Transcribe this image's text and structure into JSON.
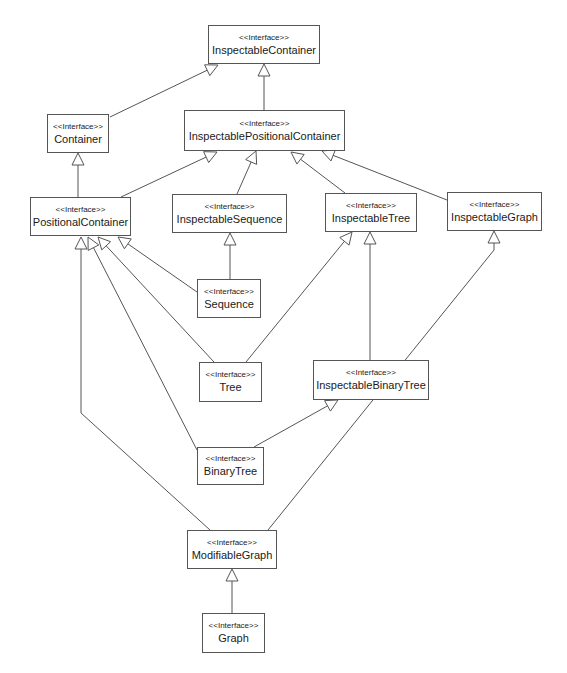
{
  "diagram": {
    "type": "uml-class-inheritance",
    "stereotype": "<<Interface>>",
    "nodes": [
      {
        "id": "InspectableContainer",
        "label": "InspectableContainer",
        "x": 208,
        "y": 25,
        "w": 112,
        "h": 39
      },
      {
        "id": "Container",
        "label": "Container",
        "x": 47,
        "y": 114,
        "w": 62,
        "h": 39
      },
      {
        "id": "InspectablePositionalContainer",
        "label": "InspectablePositionalContainer",
        "x": 184,
        "y": 110,
        "w": 161,
        "h": 41
      },
      {
        "id": "PositionalContainer",
        "label": "PositionalContainer",
        "x": 30,
        "y": 197,
        "w": 101,
        "h": 39
      },
      {
        "id": "InspectableSequence",
        "label": "InspectableSequence",
        "x": 172,
        "y": 194,
        "w": 115,
        "h": 39
      },
      {
        "id": "InspectableTree",
        "label": "InspectableTree",
        "x": 325,
        "y": 193,
        "w": 92,
        "h": 39
      },
      {
        "id": "InspectableGraph",
        "label": "InspectableGraph",
        "x": 447,
        "y": 192,
        "w": 95,
        "h": 39
      },
      {
        "id": "Sequence",
        "label": "Sequence",
        "x": 197,
        "y": 279,
        "w": 64,
        "h": 39
      },
      {
        "id": "Tree",
        "label": "Tree",
        "x": 199,
        "y": 362,
        "w": 63,
        "h": 40
      },
      {
        "id": "InspectableBinaryTree",
        "label": "InspectableBinaryTree",
        "x": 313,
        "y": 360,
        "w": 116,
        "h": 40
      },
      {
        "id": "BinaryTree",
        "label": "BinaryTree",
        "x": 197,
        "y": 447,
        "w": 67,
        "h": 38
      },
      {
        "id": "ModifiableGraph",
        "label": "ModifiableGraph",
        "x": 187,
        "y": 530,
        "w": 90,
        "h": 39
      },
      {
        "id": "Graph",
        "label": "Graph",
        "x": 202,
        "y": 613,
        "w": 63,
        "h": 40
      }
    ],
    "edges": [
      {
        "from": "InspectablePositionalContainer",
        "to": "InspectableContainer",
        "points": [
          [
            264,
            110
          ],
          [
            264,
            64
          ]
        ]
      },
      {
        "from": "Container",
        "to": "InspectableContainer",
        "points": [
          [
            110,
            117
          ],
          [
            218,
            65
          ]
        ]
      },
      {
        "from": "PositionalContainer",
        "to": "Container",
        "points": [
          [
            78,
            197
          ],
          [
            78,
            153
          ]
        ]
      },
      {
        "from": "PositionalContainer",
        "to": "InspectablePositionalContainer",
        "points": [
          [
            121,
            197
          ],
          [
            217,
            152
          ]
        ]
      },
      {
        "from": "InspectableSequence",
        "to": "InspectablePositionalContainer",
        "points": [
          [
            237,
            194
          ],
          [
            256,
            151
          ]
        ]
      },
      {
        "from": "InspectableTree",
        "to": "InspectablePositionalContainer",
        "points": [
          [
            345,
            193
          ],
          [
            291,
            152
          ]
        ]
      },
      {
        "from": "InspectableGraph",
        "to": "InspectablePositionalContainer",
        "points": [
          [
            447,
            200
          ],
          [
            322,
            151
          ]
        ]
      },
      {
        "from": "Sequence",
        "to": "InspectableSequence",
        "points": [
          [
            230,
            279
          ],
          [
            230,
            233
          ]
        ]
      },
      {
        "from": "Sequence",
        "to": "PositionalContainer",
        "points": [
          [
            197,
            292
          ],
          [
            118,
            237
          ]
        ]
      },
      {
        "from": "Tree",
        "to": "PositionalContainer",
        "points": [
          [
            214,
            362
          ],
          [
            98,
            237
          ]
        ]
      },
      {
        "from": "Tree",
        "to": "InspectableTree",
        "points": [
          [
            246,
            362
          ],
          [
            352,
            232
          ]
        ]
      },
      {
        "from": "InspectableBinaryTree",
        "to": "InspectableTree",
        "points": [
          [
            370,
            360
          ],
          [
            370,
            232
          ]
        ]
      },
      {
        "from": "BinaryTree",
        "to": "PositionalContainer",
        "points": [
          [
            197,
            450
          ],
          [
            88,
            237
          ]
        ]
      },
      {
        "from": "BinaryTree",
        "to": "InspectableBinaryTree",
        "points": [
          [
            254,
            447
          ],
          [
            338,
            400
          ]
        ]
      },
      {
        "from": "ModifiableGraph",
        "to": "PositionalContainer",
        "points": [
          [
            210,
            530
          ],
          [
            81,
            413
          ],
          [
            81,
            237
          ]
        ]
      },
      {
        "from": "ModifiableGraph",
        "to": "InspectableGraph",
        "points": [
          [
            268,
            530
          ],
          [
            494,
            250
          ],
          [
            494,
            231
          ]
        ]
      },
      {
        "from": "Graph",
        "to": "ModifiableGraph",
        "points": [
          [
            232,
            613
          ],
          [
            232,
            569
          ]
        ]
      }
    ],
    "colors": {
      "line": "#555555",
      "box_border": "#555555",
      "text": "#1a1a1a",
      "background": "#ffffff"
    }
  }
}
